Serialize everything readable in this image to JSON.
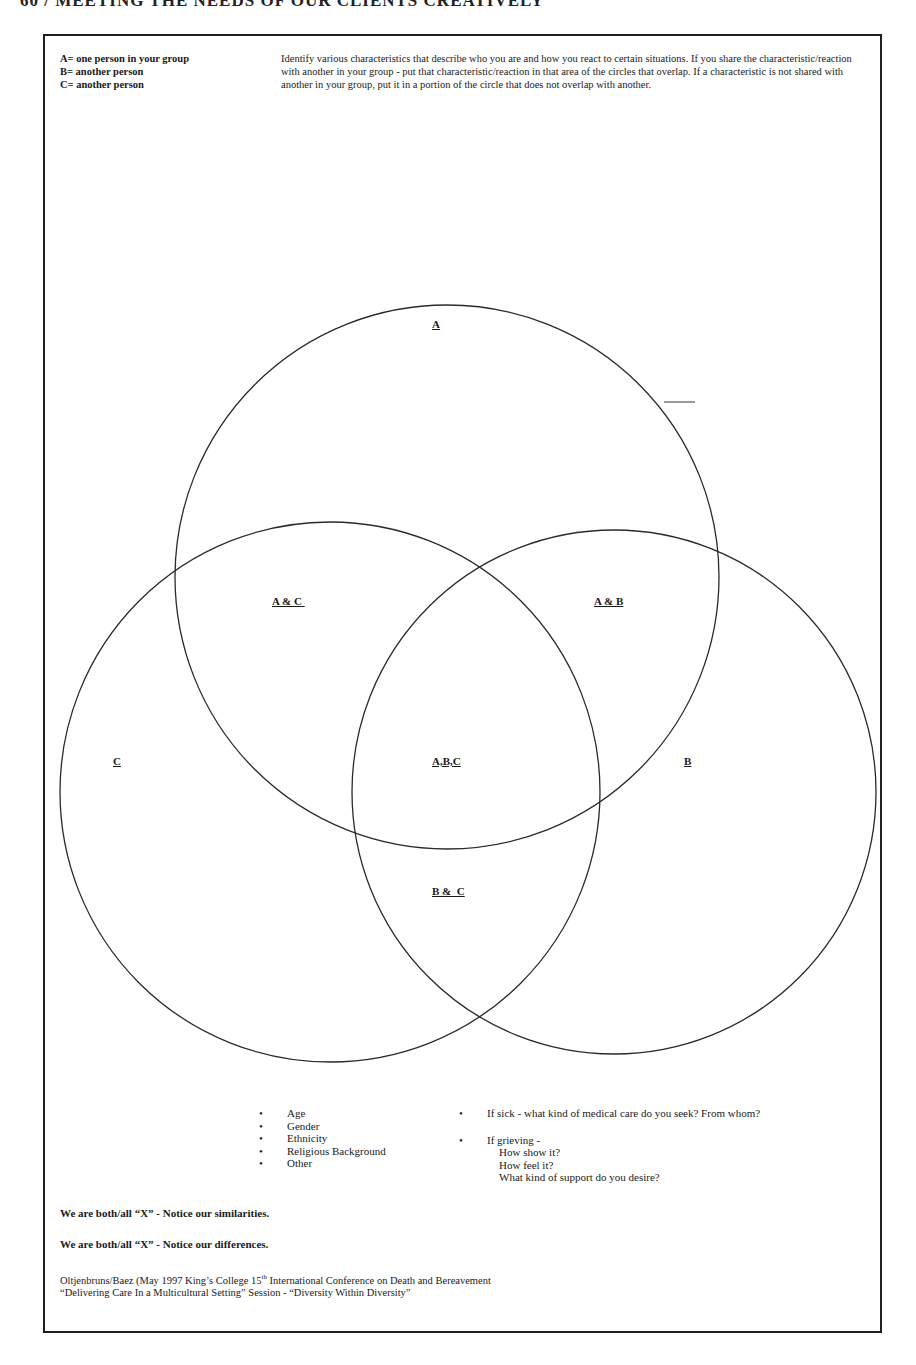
{
  "page": {
    "running_head": "60 / MEETING THE NEEDS OF OUR CLIENTS CREATIVELY"
  },
  "legend": {
    "items": [
      "A= one person in your group",
      "B= another person",
      "C= another person"
    ]
  },
  "instructions": "Identify various characteristics that describe who you are and how you react to certain situations.  If you share the characteristic/reaction  with another in your group - put that characteristic/reaction in that area of the circles that overlap.  If a characteristic is not shared with another in your group, put it in a portion of the circle that does not overlap with another.",
  "venn": {
    "circles": [
      {
        "name": "A",
        "cx": 447,
        "cy": 577,
        "r": 272
      },
      {
        "name": "B",
        "cx": 614,
        "cy": 792,
        "r": 262
      },
      {
        "name": "C",
        "cx": 330,
        "cy": 792,
        "r": 270
      }
    ],
    "stroke_color": "#2a2a2a",
    "labels": {
      "a": "A",
      "b": "B",
      "c": "C",
      "ac": "A & C ",
      "ab": "A & B",
      "abc": "A,B,C",
      "bc": "B &  C"
    }
  },
  "prompts": {
    "left_list": [
      "Age",
      "Gender",
      "Ethnicity",
      "Religious Background",
      "Other"
    ],
    "right_list": [
      {
        "text": "If sick - what kind of medical care do you seek? From whom?"
      },
      {
        "text": "If grieving -",
        "sub": [
          "How show it?",
          "How feel it?",
          "What kind of support do you desire?"
        ]
      }
    ]
  },
  "notes": {
    "similarities": "We are both/all “X” - Notice our similarities.",
    "differences": "We are both/all “X” - Notice our differences."
  },
  "credit": {
    "line1_pre": "Oltjenbruns/Baez  (May 1997  King’s College  15",
    "line1_sup": "th",
    "line1_post": " International Conference on Death and Bereavement",
    "line2": " “Delivering Care In a Multicultural Setting”  Session -  “Diversity Within Diversity”"
  }
}
